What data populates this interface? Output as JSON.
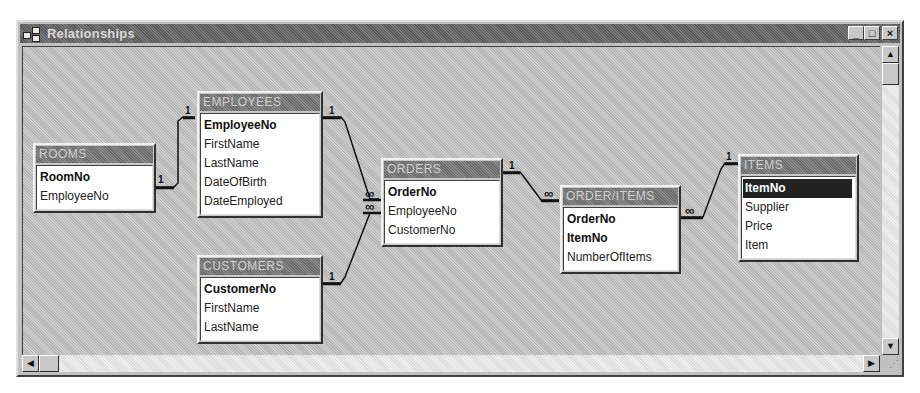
{
  "window": {
    "title": "Relationships",
    "buttons": {
      "minimize": "_",
      "maximize": "□",
      "close": "×"
    }
  },
  "scrollbars": {
    "up_arrow": "▲",
    "down_arrow": "▼",
    "left_arrow": "◀",
    "right_arrow": "▶",
    "grip": "⋰"
  },
  "tables": [
    {
      "name": "ROOMS",
      "fields": [
        {
          "name": "RoomNo",
          "key": true
        },
        {
          "name": "EmployeeNo",
          "key": false
        }
      ]
    },
    {
      "name": "EMPLOYEES",
      "fields": [
        {
          "name": "EmployeeNo",
          "key": true
        },
        {
          "name": "FirstName"
        },
        {
          "name": "LastName"
        },
        {
          "name": "DateOfBirth"
        },
        {
          "name": "DateEmployed"
        }
      ]
    },
    {
      "name": "CUSTOMERS",
      "fields": [
        {
          "name": "CustomerNo",
          "key": true
        },
        {
          "name": "FirstName"
        },
        {
          "name": "LastName"
        }
      ]
    },
    {
      "name": "ORDERS",
      "fields": [
        {
          "name": "OrderNo",
          "key": true
        },
        {
          "name": "EmployeeNo"
        },
        {
          "name": "CustomerNo"
        }
      ]
    },
    {
      "name": "ORDER/ITEMS",
      "fields": [
        {
          "name": "OrderNo",
          "key": true
        },
        {
          "name": "ItemNo",
          "key": true
        },
        {
          "name": "NumberOfItems"
        }
      ]
    },
    {
      "name": "ITEMS",
      "fields": [
        {
          "name": "ItemNo",
          "key": true,
          "selected": true
        },
        {
          "name": "Supplier"
        },
        {
          "name": "Price"
        },
        {
          "name": "Item"
        }
      ]
    }
  ],
  "relationships": [
    {
      "from": "EMPLOYEES.EmployeeNo",
      "to": "ROOMS.EmployeeNo",
      "one": "1",
      "many": "1"
    },
    {
      "from": "EMPLOYEES.EmployeeNo",
      "to": "ORDERS.EmployeeNo",
      "one": "1",
      "many": "∞"
    },
    {
      "from": "CUSTOMERS.CustomerNo",
      "to": "ORDERS.CustomerNo",
      "one": "1",
      "many": "∞"
    },
    {
      "from": "ORDERS.OrderNo",
      "to": "ORDER/ITEMS.OrderNo",
      "one": "1",
      "many": "∞"
    },
    {
      "from": "ITEMS.ItemNo",
      "to": "ORDER/ITEMS.ItemNo",
      "one": "1",
      "many": "∞"
    }
  ]
}
